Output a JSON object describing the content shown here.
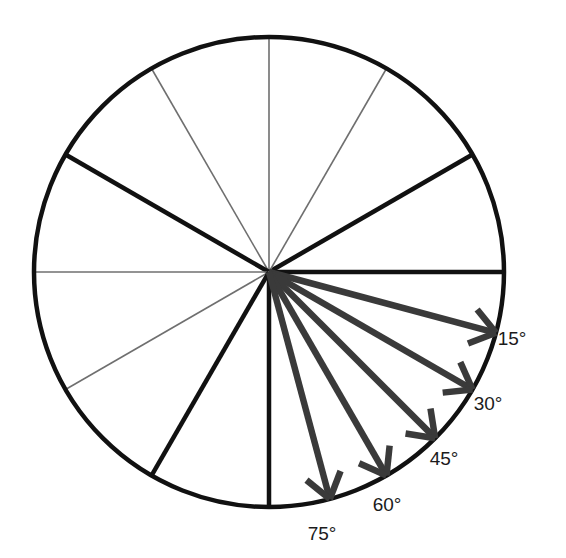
{
  "figure": {
    "background_color": "#ffffff",
    "circle": {
      "center_x": 269,
      "center_y": 272,
      "radius": 235,
      "stroke_color": "#111111",
      "stroke_width": 4.5
    },
    "major_ray_color": "#111111",
    "major_ray_width": 4.5,
    "minor_ray_color": "#6f6f6f",
    "minor_ray_width": 1.6,
    "arrow_color": "#3a3a3a",
    "arrow_width": 6.5,
    "rays": [
      {
        "name": "ray-0deg",
        "angle_deg": 0,
        "weight": "major"
      },
      {
        "name": "ray-30deg",
        "angle_deg": 30,
        "weight": "major"
      },
      {
        "name": "ray-60deg",
        "angle_deg": 60,
        "weight": "minor"
      },
      {
        "name": "ray-90deg",
        "angle_deg": 90,
        "weight": "minor"
      },
      {
        "name": "ray-120deg",
        "angle_deg": 120,
        "weight": "minor"
      },
      {
        "name": "ray-150deg",
        "angle_deg": 150,
        "weight": "major"
      },
      {
        "name": "ray-180deg",
        "angle_deg": 180,
        "weight": "minor"
      },
      {
        "name": "ray-210deg",
        "angle_deg": 210,
        "weight": "minor"
      },
      {
        "name": "ray-240deg",
        "angle_deg": 240,
        "weight": "major"
      },
      {
        "name": "ray-270deg",
        "angle_deg": 270,
        "weight": "major"
      }
    ],
    "arrows": [
      {
        "name": "arrow-15deg",
        "angle_deg": -15,
        "label": "15°",
        "label_x": 512,
        "label_y": 345
      },
      {
        "name": "arrow-30deg",
        "angle_deg": -30,
        "label": "30°",
        "label_x": 488,
        "label_y": 410
      },
      {
        "name": "arrow-45deg",
        "angle_deg": -45,
        "label": "45°",
        "label_x": 444,
        "label_y": 465
      },
      {
        "name": "arrow-60deg",
        "angle_deg": -60,
        "label": "60°",
        "label_x": 387,
        "label_y": 511
      },
      {
        "name": "arrow-75deg",
        "angle_deg": -75,
        "label": "75°",
        "label_x": 322,
        "label_y": 540
      }
    ],
    "labels": [
      "15°",
      "30°",
      "45°",
      "60°",
      "75°"
    ]
  },
  "chart_data": {
    "type": "scatter",
    "xlabel": "",
    "ylabel": "",
    "categories": [
      "15°",
      "30°",
      "45°",
      "60°",
      "75°"
    ],
    "values": [
      15,
      30,
      45,
      60,
      75
    ],
    "annotations": [
      "15°",
      "30°",
      "45°",
      "60°",
      "75°"
    ],
    "grid": false,
    "legend": "none"
  }
}
